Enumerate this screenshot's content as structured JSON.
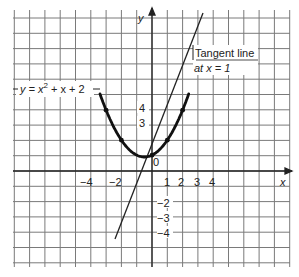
{
  "chart_data": {
    "type": "line",
    "title": "",
    "xlabel": "x",
    "ylabel": "y",
    "xlim": [
      -9,
      9
    ],
    "ylim": [
      -6,
      11
    ],
    "grid": true,
    "origin_label": "0",
    "x_ticks": [
      {
        "value": -4,
        "label": "−4"
      },
      {
        "value": -2,
        "label": "−2"
      },
      {
        "value": 1,
        "label": "1"
      },
      {
        "value": 2,
        "label": "2"
      },
      {
        "value": 3,
        "label": "3"
      },
      {
        "value": 4,
        "label": "4"
      }
    ],
    "y_ticks": [
      {
        "value": 4,
        "label": "4"
      },
      {
        "value": 3,
        "label": "3"
      },
      {
        "value": -2,
        "label": "−2"
      },
      {
        "value": -3,
        "label": "−3"
      },
      {
        "value": -4,
        "label": "−4"
      }
    ],
    "series": [
      {
        "name": "y = x² + x + 2",
        "type": "curve",
        "equation": "y = x^2 + x + 2",
        "marked_points": [
          [
            -3,
            8
          ],
          [
            -2,
            4
          ],
          [
            0,
            2
          ],
          [
            1,
            4
          ],
          [
            2,
            8
          ]
        ],
        "x_range": [
          -3.4,
          2.4
        ]
      },
      {
        "name": "Tangent line at x = 1",
        "type": "line",
        "equation": "y = 3x + 1",
        "x_range": [
          -2.5,
          3.5
        ]
      }
    ],
    "annotations": [
      {
        "text_parts": [
          "y = x",
          "2",
          " + x + 2"
        ],
        "target": "parabola"
      },
      {
        "text_lines": [
          "Tangent line",
          "at x = 1"
        ],
        "target": "tangent"
      }
    ]
  },
  "labels": {
    "x_axis": "x",
    "y_axis": "y",
    "origin": "0",
    "parabola_pre": "y = x",
    "parabola_exp": "2",
    "parabola_post": " + x + 2",
    "tangent_line1": "Tangent line",
    "tangent_line2": "at x = 1",
    "xt_m4": "−4",
    "xt_m2": "−2",
    "xt_1": "1",
    "xt_2": "2",
    "xt_3": "3",
    "xt_4": "4",
    "yt_4": "4",
    "yt_3": "3",
    "yt_m2": "−2",
    "yt_m3": "−3",
    "yt_m4": "−4"
  }
}
